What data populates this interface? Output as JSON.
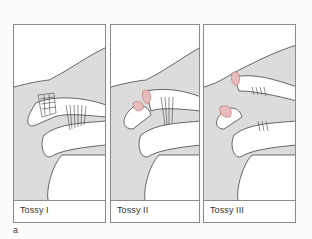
{
  "figure": {
    "panel_letter": "a",
    "panels": [
      {
        "label": "Tossy I",
        "description": "Acromioclavicular ligament sprain, coracoclavicular ligaments intact"
      },
      {
        "label": "Tossy II",
        "description": "Acromioclavicular ligament torn, coracoclavicular ligaments stretched"
      },
      {
        "label": "Tossy III",
        "description": "Acromioclavicular and coracoclavicular ligaments torn"
      }
    ]
  },
  "colors": {
    "tissue_fill": "#dcdcdc",
    "outline": "#555555",
    "injury_accent": "#d49a9a",
    "panel_border": "#8a8a8a"
  }
}
